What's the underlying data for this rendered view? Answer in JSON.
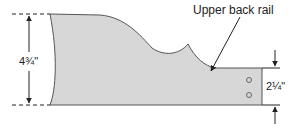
{
  "diagram": {
    "part_label": "Upper back rail",
    "overall_height_label": "4¾\"",
    "end_height_label": "2¼\"",
    "colors": {
      "fill": "#d9d9d9",
      "outline": "#555555",
      "lines": "#222222",
      "background": "#ffffff"
    },
    "holes": 2
  }
}
